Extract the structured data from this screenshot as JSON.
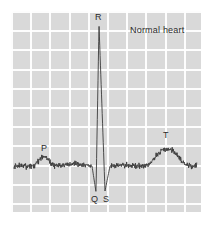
{
  "figure": {
    "kind": "ecg-trace",
    "title": "Normal heart",
    "panel": {
      "background_color": "#d9d9d9",
      "gridline_color": "#ffffff",
      "grid_cell_px": 19.2,
      "left": 11,
      "top": 11,
      "width": 190,
      "height": 201
    },
    "trace": {
      "color": "#3a3a3a",
      "line_width": 0.9,
      "baseline_y": 166,
      "noise": true
    }
  },
  "annotations": [
    {
      "id": "wave-p",
      "text": "P",
      "x": 41,
      "y": 145
    },
    {
      "id": "wave-r",
      "text": "R",
      "x": 95,
      "y": 13
    },
    {
      "id": "wave-q",
      "text": "Q",
      "x": 91,
      "y": 195
    },
    {
      "id": "wave-s",
      "text": "S",
      "x": 103,
      "y": 195
    },
    {
      "id": "wave-t",
      "text": "T",
      "x": 163,
      "y": 132
    },
    {
      "id": "panel-title",
      "text": "Normal heart",
      "x": 130,
      "y": 26
    }
  ],
  "chart_data": {
    "type": "line",
    "title": "Normal heart",
    "xlabel": "",
    "ylabel": "",
    "grid": true,
    "legend_position": "none",
    "annotations": [
      "P",
      "Q",
      "R",
      "S",
      "T",
      "Normal heart"
    ],
    "series": [
      {
        "name": "ECG waveform",
        "color": "#3a3a3a",
        "description": "Single normal sinus rhythm complex with small P wave, tall narrow R spike flanked by Q and S troughs, and a broad rounded T wave on a noisy isoelectric baseline.",
        "features": [
          {
            "label": "baseline-start",
            "x": 14,
            "y": 166
          },
          {
            "label": "P-onset",
            "x": 33,
            "y": 166
          },
          {
            "label": "P-peak",
            "x": 44,
            "y": 157
          },
          {
            "label": "P-offset",
            "x": 55,
            "y": 166
          },
          {
            "label": "PR-segment",
            "x": 72,
            "y": 167
          },
          {
            "label": "Q-trough",
            "x": 96,
            "y": 192
          },
          {
            "label": "R-peak",
            "x": 99,
            "y": 25
          },
          {
            "label": "S-trough",
            "x": 105,
            "y": 191
          },
          {
            "label": "ST-segment",
            "x": 123,
            "y": 166
          },
          {
            "label": "T-onset",
            "x": 143,
            "y": 164
          },
          {
            "label": "T-peak",
            "x": 167,
            "y": 149
          },
          {
            "label": "T-offset",
            "x": 186,
            "y": 165
          },
          {
            "label": "baseline-end",
            "x": 197,
            "y": 164
          }
        ]
      }
    ]
  }
}
